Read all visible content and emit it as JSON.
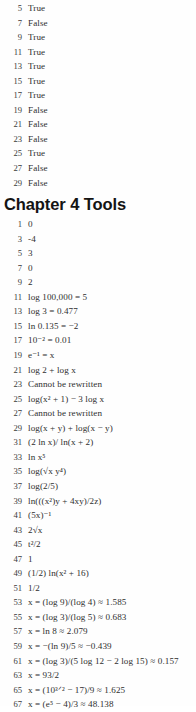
{
  "page": {
    "background": "#fefefe",
    "text_color": "#2e2e2e"
  },
  "sections": [
    {
      "id": "chapter-3-continued",
      "heading": null,
      "answers": [
        {
          "num": "5",
          "value": "True"
        },
        {
          "num": "7",
          "value": "False"
        },
        {
          "num": "9",
          "value": "True"
        },
        {
          "num": "11",
          "value": "True"
        },
        {
          "num": "13",
          "value": "True"
        },
        {
          "num": "15",
          "value": "True"
        },
        {
          "num": "17",
          "value": "True"
        },
        {
          "num": "19",
          "value": "False"
        },
        {
          "num": "21",
          "value": "False"
        },
        {
          "num": "23",
          "value": "False"
        },
        {
          "num": "25",
          "value": "True"
        },
        {
          "num": "27",
          "value": "False"
        },
        {
          "num": "29",
          "value": "False"
        }
      ]
    },
    {
      "id": "chapter-4-tools",
      "heading": "Chapter 4 Tools",
      "answers": [
        {
          "num": "1",
          "value": "0"
        },
        {
          "num": "3",
          "value": "-4"
        },
        {
          "num": "5",
          "value": "3"
        },
        {
          "num": "7",
          "value": "0"
        },
        {
          "num": "9",
          "value": "2"
        },
        {
          "num": "11",
          "value": "log 100,000 = 5"
        },
        {
          "num": "13",
          "value": "log 3 = 0.477"
        },
        {
          "num": "15",
          "value": "ln 0.135 = −2"
        },
        {
          "num": "17",
          "value": "10⁻² = 0.01"
        },
        {
          "num": "19",
          "value": "e⁻¹ = x"
        },
        {
          "num": "21",
          "value": "log 2 + log x"
        },
        {
          "num": "23",
          "value": "Cannot be rewritten"
        },
        {
          "num": "25",
          "value": "log(x² + 1) − 3 log x"
        },
        {
          "num": "27",
          "value": "Cannot be rewritten"
        },
        {
          "num": "29",
          "value": "log(x + y) + log(x − y)"
        },
        {
          "num": "31",
          "value": "(2 ln x)/ ln(x + 2)"
        },
        {
          "num": "33",
          "value": "ln x⁵"
        },
        {
          "num": "35",
          "value": "log(√x y⁴)"
        },
        {
          "num": "37",
          "value": "log(2/5)"
        },
        {
          "num": "39",
          "value": "ln(((x²)y + 4xy)/2z)"
        },
        {
          "num": "41",
          "value": "(5x)⁻¹"
        },
        {
          "num": "43",
          "value": "2√x"
        },
        {
          "num": "45",
          "value": "t²/2"
        },
        {
          "num": "47",
          "value": "1"
        },
        {
          "num": "49",
          "value": "(1/2) ln(x² + 16)"
        },
        {
          "num": "51",
          "value": "1/2"
        },
        {
          "num": "53",
          "value": "x = (log 9)/(log 4) ≈ 1.585"
        },
        {
          "num": "55",
          "value": "x = (log 3)/(log 5) ≈ 0.683"
        },
        {
          "num": "57",
          "value": "x = ln 8 ≈ 2.079"
        },
        {
          "num": "59",
          "value": "x = −(ln 9)/5 ≈ −0.439"
        },
        {
          "num": "61",
          "value": "x = (log 3)/(5 log 12 − 2 log 15) ≈ 0.157"
        },
        {
          "num": "63",
          "value": "x = 93/2"
        },
        {
          "num": "65",
          "value": "x = (10³ᐟ² − 17)/9 ≈ 1.625"
        },
        {
          "num": "67",
          "value": "x = (e⁵ − 4)/3 ≈ 48.138"
        }
      ]
    }
  ]
}
